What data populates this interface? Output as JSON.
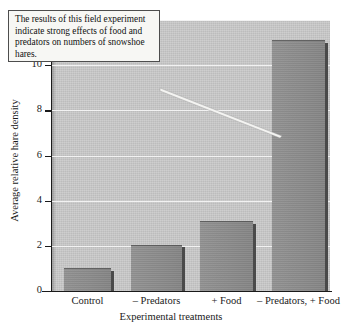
{
  "chart_data": {
    "type": "bar",
    "title": "",
    "categories": [
      "Control",
      "– Predators",
      "+ Food",
      "– Predators, + Food"
    ],
    "values": [
      1.0,
      2.05,
      3.1,
      11.1
    ],
    "xlabel": "Experimental treatments",
    "ylabel": "Average relative hare density",
    "ylim": [
      0,
      12
    ],
    "yticks": [
      0,
      2,
      4,
      6,
      8,
      10,
      12
    ],
    "ytick_labels": [
      "0",
      "2",
      "4",
      "6",
      "8",
      "10",
      "12"
    ],
    "grid": true,
    "grid_axis": "y",
    "legend": false,
    "annotations": [
      {
        "text": "The results of this field experiment indicate strong effects of food and predators on numbers of snowshoe hares.",
        "points_to": "– Predators, + Food"
      }
    ],
    "colors": {
      "bar_fill": "#8c8c8c",
      "bar_shadow": "#4a4a4a",
      "plot_background": "#c9c9c9",
      "gridline": "#f2f2f2",
      "axis": "#1a1a1a",
      "annotation_background": "#f7f7f4",
      "annotation_border": "#4d4d4d",
      "figure_background": "#ffffff"
    }
  },
  "axis": {
    "y_title": "Average relative hare density",
    "x_title": "Experimental treatments"
  },
  "annotation": {
    "text": "The results of this field experiment indicate strong effects of food and predators on numbers of snowshoe hares."
  }
}
